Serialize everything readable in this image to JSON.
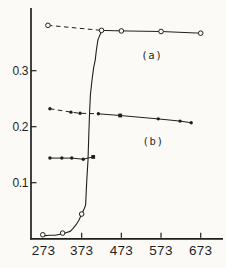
{
  "figure": {
    "background": "#fbfaf6",
    "ink": "#1f1f1f",
    "marker_fill": "#fbfaf6"
  },
  "chart_data": {
    "type": "line",
    "title": "",
    "xlabel": "",
    "ylabel": "",
    "xlim": [
      245,
      729
    ],
    "ylim": [
      0,
      0.412
    ],
    "grid": false,
    "x_axis": {
      "tick_values": [
        373,
        473,
        573,
        673
      ],
      "labels": [
        {
          "text": "273",
          "x": 277
        },
        {
          "text": "373",
          "x": 373
        },
        {
          "text": "473",
          "x": 473
        },
        {
          "text": "573",
          "x": 573
        },
        {
          "text": "673",
          "x": 673
        }
      ]
    },
    "y_axis": {
      "tick_values": [
        0.1,
        0.2,
        0.3
      ],
      "labels": [
        "0.1",
        "0.2",
        "0.3"
      ]
    },
    "series": [
      {
        "id": "a",
        "name": "series-a-open-circles",
        "marker": "open-circle",
        "points": [
          [
            288,
            0.381
          ],
          [
            423,
            0.372
          ],
          [
            473,
            0.371
          ],
          [
            573,
            0.37
          ],
          [
            673,
            0.367
          ]
        ],
        "marker_overrides": {},
        "segments": [
          {
            "style": "dashed",
            "from": 0,
            "to": 1
          },
          {
            "style": "solid",
            "from": 1,
            "to": 4
          }
        ]
      },
      {
        "id": "b",
        "name": "series-b-filled-dots",
        "marker": "dot",
        "points": [
          [
            293,
            0.232
          ],
          [
            346,
            0.226
          ],
          [
            369,
            0.224
          ],
          [
            415,
            0.223
          ],
          [
            470,
            0.22
          ],
          [
            566,
            0.214
          ],
          [
            621,
            0.21
          ],
          [
            649,
            0.207
          ]
        ],
        "marker_overrides": {
          "4": "square"
        },
        "segments": [
          {
            "style": "dashed",
            "from": 0,
            "to": 3
          },
          {
            "style": "solid",
            "from": 3,
            "to": 7
          }
        ]
      },
      {
        "id": "c",
        "name": "series-c-short-flat",
        "marker": "dot",
        "points": [
          [
            293,
            0.144
          ],
          [
            323,
            0.144
          ],
          [
            348,
            0.144
          ],
          [
            377,
            0.142
          ],
          [
            402,
            0.146
          ]
        ],
        "marker_overrides": {
          "4": "square"
        },
        "segments": [
          {
            "style": "solid",
            "from": 0,
            "to": 4
          }
        ]
      },
      {
        "id": "transition-markers",
        "name": "sigmoid-open-circles",
        "marker": "open-circle",
        "points": [
          [
            275,
            0.007
          ],
          [
            325,
            0.01
          ],
          [
            373,
            0.044
          ]
        ],
        "marker_overrides": {},
        "segments": []
      }
    ],
    "sigmoid_curve": {
      "style": "solid",
      "trace": [
        [
          274,
          0.005
        ],
        [
          293,
          0.006
        ],
        [
          306,
          0.006
        ],
        [
          326,
          0.009
        ],
        [
          335,
          0.011
        ],
        [
          344,
          0.013
        ],
        [
          351,
          0.018
        ],
        [
          359,
          0.025
        ],
        [
          366,
          0.033
        ],
        [
          373,
          0.044
        ],
        [
          379,
          0.053
        ],
        [
          383,
          0.06
        ],
        [
          386,
          0.105
        ],
        [
          389,
          0.14
        ],
        [
          391,
          0.185
        ],
        [
          393,
          0.226
        ],
        [
          395,
          0.257
        ],
        [
          399,
          0.283
        ],
        [
          403,
          0.305
        ],
        [
          407,
          0.319
        ],
        [
          410,
          0.337
        ],
        [
          414,
          0.355
        ],
        [
          419,
          0.364
        ],
        [
          423,
          0.37
        ]
      ]
    },
    "annotations": [
      {
        "text": "(a)",
        "x": 550,
        "value": 0.328
      },
      {
        "text": "(b)",
        "x": 553,
        "value": 0.173
      }
    ],
    "layout": {
      "canvas": {
        "width": 226,
        "height": 268
      },
      "x_scale": {
        "data1": 273,
        "px1": 42,
        "data2": 673,
        "px2": 200.7
      },
      "y_scale": {
        "val1": 0,
        "px1": 238.7,
        "val2": 0.3,
        "px2": 70.7
      },
      "axis": {
        "x_px": 31,
        "y_top_px": 8,
        "y_bottom_px": 238.8,
        "x_right_px": 223
      },
      "x_tick_len": 5,
      "y_tick_len": 5.5
    }
  }
}
